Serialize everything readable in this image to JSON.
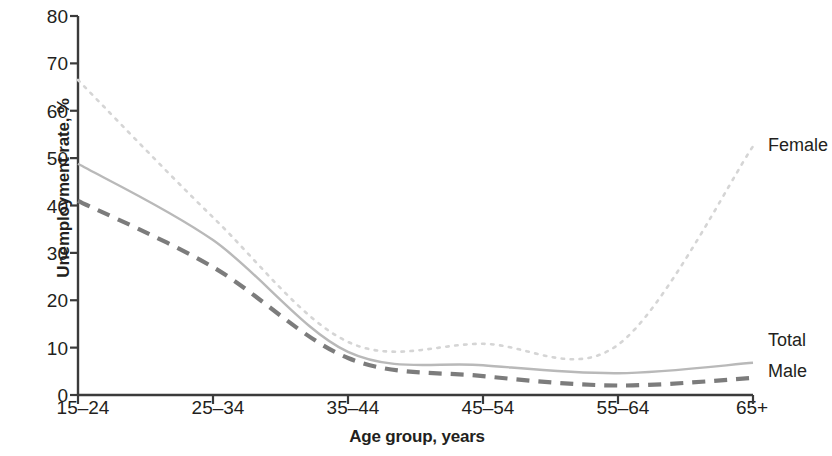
{
  "chart_data": {
    "type": "line",
    "title": "",
    "xlabel": "Age group, years",
    "ylabel": "Unemployment rate, %",
    "categories": [
      "15–24",
      "25–34",
      "35–44",
      "45–54",
      "55–64",
      "65+"
    ],
    "ylim": [
      0,
      80
    ],
    "yticks": [
      0,
      10,
      20,
      30,
      40,
      50,
      60,
      70,
      80
    ],
    "ytick_labels": [
      "0",
      "10",
      "20",
      "30",
      "40",
      "50",
      "60",
      "70",
      "80"
    ],
    "grid": false,
    "legend_position": "right-of-line-ends",
    "series": [
      {
        "name": "Female",
        "values": [
          66.5,
          37.5,
          11.2,
          10.8,
          10.6,
          52.5
        ],
        "style": "dotted",
        "color": "#d5d5d5"
      },
      {
        "name": "Total",
        "values": [
          48.8,
          32.7,
          9.1,
          6.3,
          4.6,
          6.8
        ],
        "style": "solid",
        "color": "#b9b9b9"
      },
      {
        "name": "Male",
        "values": [
          41.0,
          27.0,
          7.8,
          4.0,
          2.0,
          3.6
        ],
        "style": "dashed",
        "color": "#7c7c7c"
      }
    ]
  },
  "axis": {
    "y_title": "Unemployment rate, %",
    "x_title": "Age group, years",
    "y_tick_labels": [
      "80",
      "70",
      "60",
      "50",
      "40",
      "30",
      "20",
      "10",
      "0"
    ],
    "x_tick_labels": [
      "15–24",
      "25–34",
      "35–44",
      "45–54",
      "55–64",
      "65+"
    ],
    "axis_color": "#3b3b3b"
  },
  "labels": {
    "female": "Female",
    "total": "Total",
    "male": "Male"
  }
}
